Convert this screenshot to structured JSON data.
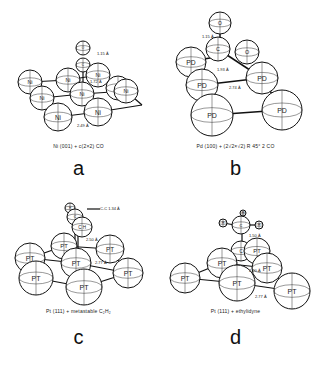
{
  "panels": [
    {
      "id": "a",
      "letter": "a",
      "caption": "Ni (001) + c(2×2) CO",
      "surface_atom": "Ni",
      "adsorbate": "CO",
      "distances": [
        "1.15 Å",
        "1.72 Å",
        "2.49 Å"
      ],
      "atoms": [
        {
          "label": "O",
          "kind": "adsorbate"
        },
        {
          "label": "C",
          "kind": "adsorbate"
        },
        {
          "label": "Ni",
          "kind": "surface"
        },
        {
          "label": "Ni",
          "kind": "surface"
        },
        {
          "label": "Ni",
          "kind": "surface"
        },
        {
          "label": "Ni",
          "kind": "surface"
        },
        {
          "label": "Ni",
          "kind": "surface"
        },
        {
          "label": "Ni",
          "kind": "surface"
        },
        {
          "label": "Ni",
          "kind": "surface"
        },
        {
          "label": "Ni",
          "kind": "surface"
        },
        {
          "label": "Ni",
          "kind": "surface"
        }
      ]
    },
    {
      "id": "b",
      "letter": "b",
      "caption": "Pd (100) + (2√2×√2) R 45° 2 CO",
      "surface_atom": "Pd",
      "adsorbate": "2 CO",
      "distances": [
        "1.15 Å",
        "1.93 Å",
        "2.74 Å"
      ],
      "atoms": [
        {
          "label": "O",
          "kind": "adsorbate"
        },
        {
          "label": "C",
          "kind": "adsorbate"
        },
        {
          "label": "O",
          "kind": "adsorbate"
        },
        {
          "label": "PD",
          "kind": "surface"
        },
        {
          "label": "PD",
          "kind": "surface"
        },
        {
          "label": "PD",
          "kind": "surface"
        },
        {
          "label": "PD",
          "kind": "surface"
        },
        {
          "label": "PD",
          "kind": "surface"
        }
      ]
    },
    {
      "id": "c",
      "letter": "c",
      "caption": "Pt (111) + metastable C₂H₂",
      "surface_atom": "Pt",
      "adsorbate": "C₂H₂",
      "distances": [
        "C-C 1.34 Å",
        "2.50 Å",
        "2.77 Å"
      ],
      "atoms": [
        {
          "label": "H",
          "kind": "adsorbate"
        },
        {
          "label": "C",
          "kind": "adsorbate"
        },
        {
          "label": "C H",
          "kind": "adsorbate"
        },
        {
          "label": "PT",
          "kind": "surface"
        },
        {
          "label": "PT",
          "kind": "surface"
        },
        {
          "label": "PT",
          "kind": "surface"
        },
        {
          "label": "PT",
          "kind": "surface"
        },
        {
          "label": "PT",
          "kind": "surface"
        },
        {
          "label": "PT",
          "kind": "surface"
        },
        {
          "label": "PT",
          "kind": "surface"
        }
      ]
    },
    {
      "id": "d",
      "letter": "d",
      "caption": "Pt (111) + ethylidyne",
      "surface_atom": "Pt",
      "adsorbate": "ethylidyne",
      "distances": [
        "1.50 Å",
        "2.00 Å",
        "2.77 Å"
      ],
      "atoms": [
        {
          "label": "H",
          "kind": "adsorbate"
        },
        {
          "label": "H",
          "kind": "adsorbate"
        },
        {
          "label": "H",
          "kind": "adsorbate"
        },
        {
          "label": "C",
          "kind": "adsorbate"
        },
        {
          "label": "C",
          "kind": "adsorbate"
        },
        {
          "label": "PT",
          "kind": "surface"
        },
        {
          "label": "PT",
          "kind": "surface"
        },
        {
          "label": "PT",
          "kind": "surface"
        },
        {
          "label": "PT",
          "kind": "surface"
        },
        {
          "label": "PT",
          "kind": "surface"
        },
        {
          "label": "PT",
          "kind": "surface"
        }
      ]
    }
  ]
}
